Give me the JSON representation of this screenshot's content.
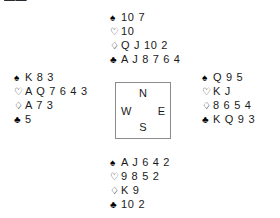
{
  "diagram": {
    "type": "bridge-deal",
    "background_color": "#ffffff",
    "text_color": "#1a1a1a",
    "border_color": "#8c8c8c",
    "clipped_top_left_mark": "▬▬"
  },
  "compass": {
    "north": "N",
    "west": "W",
    "east": "E",
    "south": "S"
  },
  "suits": {
    "spade": "♠",
    "heart": "♡",
    "diamond": "♢",
    "club": "♣"
  },
  "hands": {
    "north": {
      "label": "North",
      "spades": "10 7",
      "hearts": "10",
      "diamonds": "Q J 10 2",
      "clubs": "A J 8 7 6 4"
    },
    "west": {
      "label": "West",
      "spades": "K 8 3",
      "hearts": "A Q 7 6 4 3",
      "diamonds": "A 7 3",
      "clubs": "5"
    },
    "east": {
      "label": "East",
      "spades": "Q 9 5",
      "hearts": "K J",
      "diamonds": "8 6 5 4",
      "clubs": "K Q 9 3"
    },
    "south": {
      "label": "South",
      "spades": "A J 6 4 2",
      "hearts": "9 8 5 2",
      "diamonds": "K 9",
      "clubs": "10 2"
    }
  }
}
